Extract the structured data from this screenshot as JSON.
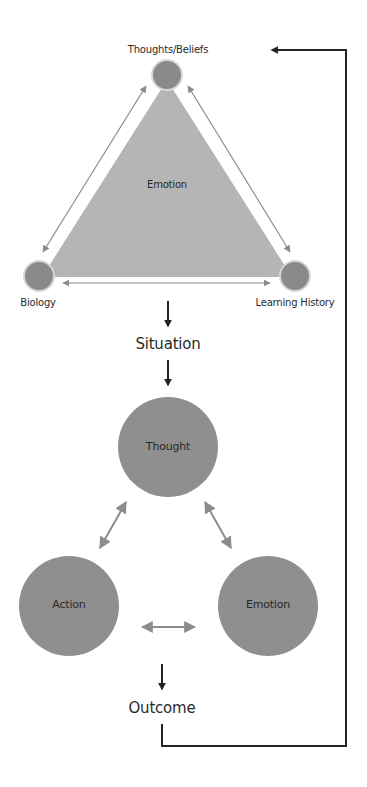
{
  "diagram": {
    "top_model": {
      "nodes": [
        {
          "id": "thoughts_beliefs",
          "label": "Thoughts/Beliefs"
        },
        {
          "id": "biology",
          "label": "Biology"
        },
        {
          "id": "learning_history",
          "label": "Learning History"
        }
      ],
      "center_label": "Emotion",
      "edges": [
        {
          "from": "thoughts_beliefs",
          "to": "biology",
          "type": "bidirectional"
        },
        {
          "from": "thoughts_beliefs",
          "to": "learning_history",
          "type": "bidirectional"
        },
        {
          "from": "biology",
          "to": "learning_history",
          "type": "bidirectional"
        }
      ]
    },
    "flow": {
      "situation_label": "Situation",
      "outcome_label": "Outcome"
    },
    "bottom_model": {
      "nodes": [
        {
          "id": "thought",
          "label": "Thought"
        },
        {
          "id": "action",
          "label": "Action"
        },
        {
          "id": "emotion",
          "label": "Emotion"
        }
      ],
      "edges": [
        {
          "from": "thought",
          "to": "action",
          "type": "bidirectional"
        },
        {
          "from": "thought",
          "to": "emotion",
          "type": "bidirectional"
        },
        {
          "from": "action",
          "to": "emotion",
          "type": "bidirectional"
        }
      ]
    },
    "feedback_loop": {
      "from": "Outcome",
      "to": "Thoughts/Beliefs"
    },
    "colors": {
      "triangle_fill": "#b5b5b5",
      "small_node_fill": "#8a8a8a",
      "big_node_fill": "#8f8f8f",
      "gray_arrow": "#8c8c8c",
      "black_arrow": "#222222",
      "text": "#2a2a2a"
    }
  }
}
